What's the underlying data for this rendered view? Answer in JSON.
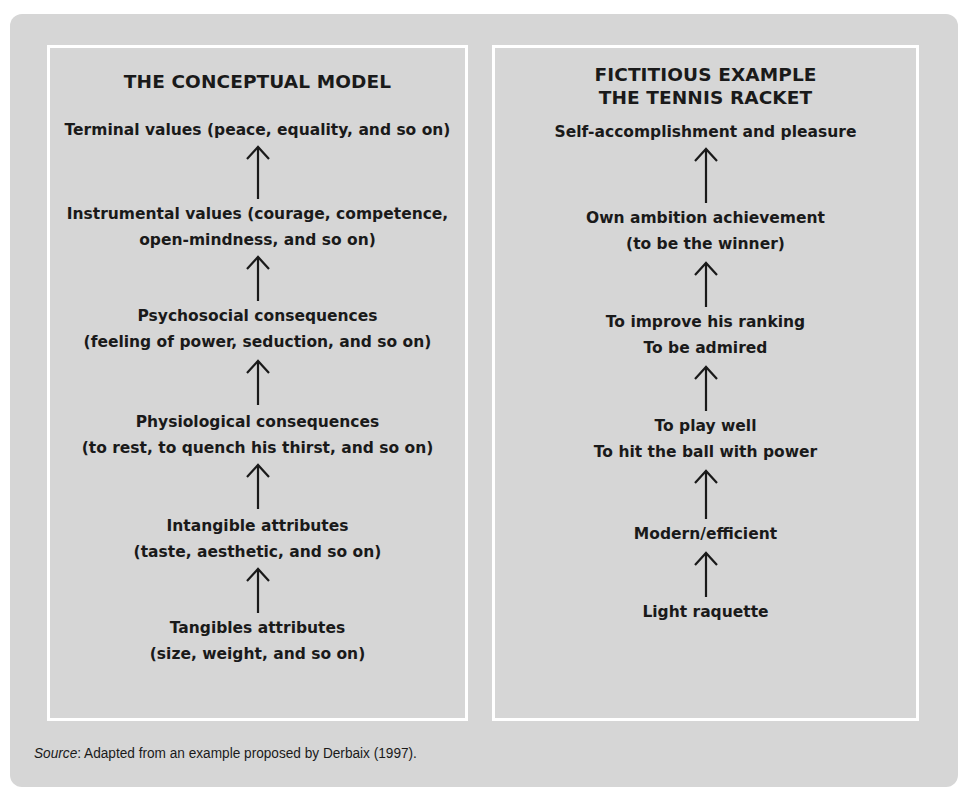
{
  "left_column": {
    "title": "THE CONCEPTUAL MODEL",
    "nodes": [
      {
        "line1": "Terminal values (peace, equality, and so on)",
        "line2": ""
      },
      {
        "line1": "Instrumental values (courage, competence,",
        "line2": "open-mindness, and so on)"
      },
      {
        "line1": "Psychosocial consequences",
        "line2": "(feeling of power, seduction, and so on)"
      },
      {
        "line1": "Physiological consequences",
        "line2": "(to rest, to quench his thirst, and so on)"
      },
      {
        "line1": "Intangible attributes",
        "line2": "(taste, aesthetic, and so on)"
      },
      {
        "line1": "Tangibles attributes",
        "line2": "(size, weight, and so on)"
      }
    ]
  },
  "right_column": {
    "title_line1": "FICTITIOUS EXAMPLE",
    "title_line2": "THE TENNIS RACKET",
    "nodes": [
      {
        "line1": "Self-accomplishment and pleasure",
        "line2": ""
      },
      {
        "line1": "Own ambition achievement",
        "line2": "(to be the winner)"
      },
      {
        "line1": "To improve his ranking",
        "line2": "To be admired"
      },
      {
        "line1": "To play well",
        "line2": "To hit the ball with power"
      },
      {
        "line1": "Modern/efficient",
        "line2": ""
      },
      {
        "line1": "Light raquette",
        "line2": ""
      }
    ]
  },
  "arrow_icon": "up-arrow",
  "source": {
    "label": "Source",
    "text": ": Adapted from an example proposed by Derbaix (1997)."
  },
  "colors": {
    "panel_background": "#d6d6d6",
    "box_border": "#ffffff",
    "text": "#1a1a1a"
  }
}
